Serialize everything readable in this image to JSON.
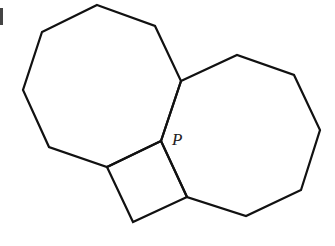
{
  "diagram": {
    "type": "geometry-figure",
    "shapes": [
      {
        "name": "left-octagon",
        "points": "97,5 155,26 181,81 161,141 107,167 49,147 23,90 42,32"
      },
      {
        "name": "right-octagon",
        "points": "181,81 237,55 294,75 320,130 301,190 246,216 187,197 161,141"
      },
      {
        "name": "square",
        "points": "161,141 107,167 133,222 187,197"
      }
    ],
    "labels": [
      {
        "text": "P",
        "x": 172,
        "y": 145
      }
    ],
    "colors": {
      "stroke": "#111111",
      "background": "#ffffff"
    }
  }
}
